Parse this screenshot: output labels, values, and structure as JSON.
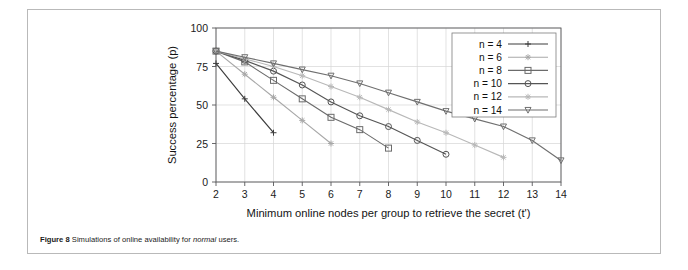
{
  "caption": {
    "figure_label": "Figure 8",
    "text_before": " Simulations of online availability for ",
    "emphasis": "normal",
    "text_after": " users."
  },
  "chart_data": {
    "type": "line",
    "title": "",
    "xlabel": "Minimum online nodes per group to retrieve the secret (t')",
    "ylabel": "Success percentage (p)",
    "xlim": [
      2,
      14
    ],
    "ylim": [
      0,
      100
    ],
    "xticks": [
      "2",
      "3",
      "4",
      "5",
      "6",
      "7",
      "8",
      "9",
      "10",
      "11",
      "12",
      "13",
      "14"
    ],
    "yticks": [
      "0",
      "25",
      "50",
      "75",
      "100"
    ],
    "grid": true,
    "legend_position": "upper-right-inside",
    "series": [
      {
        "name": "n = 4",
        "marker": "plus",
        "color": "#3d3d3d",
        "x": [
          2,
          3,
          4
        ],
        "values": [
          77,
          54,
          32
        ]
      },
      {
        "name": "n = 6",
        "marker": "star",
        "color": "#a8a8a8",
        "x": [
          2,
          3,
          4,
          5,
          6
        ],
        "values": [
          85,
          70,
          55,
          40,
          25
        ]
      },
      {
        "name": "n = 8",
        "marker": "square",
        "color": "#6b6b6b",
        "x": [
          2,
          3,
          4,
          5,
          6,
          7,
          8
        ],
        "values": [
          85,
          78,
          66,
          54,
          42,
          34,
          22
        ]
      },
      {
        "name": "n = 10",
        "marker": "circle",
        "color": "#555555",
        "x": [
          2,
          3,
          4,
          5,
          6,
          7,
          8,
          9,
          10
        ],
        "values": [
          85,
          79,
          72,
          63,
          52,
          43,
          36,
          27,
          18
        ]
      },
      {
        "name": "n = 12",
        "marker": "star-light",
        "color": "#b8b8b8",
        "x": [
          2,
          3,
          4,
          5,
          6,
          7,
          8,
          9,
          10,
          11,
          12
        ],
        "values": [
          85,
          80,
          75,
          69,
          62,
          55,
          47,
          39,
          32,
          24,
          16
        ]
      },
      {
        "name": "n = 14",
        "marker": "triangle-down",
        "color": "#6f6f6f",
        "x": [
          2,
          3,
          4,
          5,
          6,
          7,
          8,
          9,
          10,
          11,
          12,
          13,
          14
        ],
        "values": [
          85,
          81,
          77,
          73,
          69,
          64,
          58,
          52,
          46,
          41,
          36,
          27,
          14
        ]
      }
    ]
  }
}
